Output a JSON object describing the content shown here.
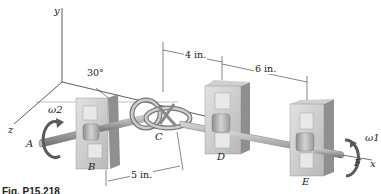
{
  "figure": {
    "caption": "Fig. P15.218",
    "axes": {
      "x": "x",
      "y": "y",
      "z": "z"
    },
    "angle_label": "30°",
    "points": {
      "A": "A",
      "B": "B",
      "C": "C",
      "D": "D",
      "E": "E",
      "F": "F"
    },
    "angular_velocities": {
      "left": "ω2",
      "right": "ω1"
    },
    "dimensions": {
      "CD": "4 in.",
      "DE": "6 in.",
      "BC": "5 in."
    },
    "colors": {
      "shaft": "#9a9a9a",
      "block_face": "#c9c9c9",
      "block_side": "#8f8f8f",
      "bearing": "#b5b5b5",
      "arrow": "#5a5a5a",
      "line": "#333333"
    }
  }
}
